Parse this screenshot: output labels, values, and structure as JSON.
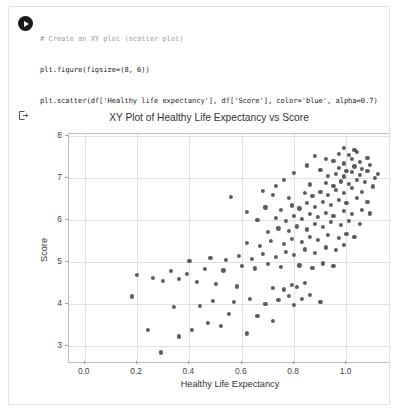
{
  "notebook": {
    "run_button": "run-cell",
    "output_marker": "output-arrow",
    "code_lines": [
      "# Create an XY plot (scatter plot)",
      "plt.figure(figsize=(8, 6))",
      "plt.scatter(df['Healthy life expectancy'], df['Score'], color='blue', alpha=0.7)",
      "plt.xlabel('Healthy Life Expectancy')",
      "plt.ylabel('Score')",
      "plt.title('XY Plot of Healthy Life Expectancy vs Score')",
      "plt.grid(True)",
      "plt.show()"
    ]
  },
  "chart_data": {
    "type": "scatter",
    "title": "XY Plot of Healthy Life Expectancy vs Score",
    "xlabel": "Healthy Life Expectancy",
    "ylabel": "Score",
    "grid": true,
    "legend": null,
    "marker_color": "#2f2f2f",
    "marker_alpha": 0.7,
    "xlim": [
      -0.06,
      1.17
    ],
    "ylim": [
      2.62,
      8.05
    ],
    "xticks": [
      0.0,
      0.2,
      0.4,
      0.6,
      0.8,
      1.0
    ],
    "xticklabels": [
      "0.0",
      "0.2",
      "0.4",
      "0.6",
      "0.8",
      "1.0"
    ],
    "yticks": [
      3,
      4,
      5,
      6,
      7,
      8
    ],
    "yticklabels": [
      "3",
      "4",
      "5",
      "6",
      "7",
      "8"
    ],
    "points": [
      [
        0.29,
        2.85
      ],
      [
        0.36,
        3.23
      ],
      [
        0.41,
        3.38
      ],
      [
        0.62,
        3.3
      ],
      [
        0.72,
        3.6
      ],
      [
        0.24,
        3.38
      ],
      [
        0.47,
        3.55
      ],
      [
        0.52,
        3.47
      ],
      [
        0.55,
        3.77
      ],
      [
        0.66,
        3.72
      ],
      [
        0.18,
        4.18
      ],
      [
        0.34,
        3.93
      ],
      [
        0.44,
        3.95
      ],
      [
        0.49,
        4.07
      ],
      [
        0.57,
        4.05
      ],
      [
        0.63,
        4.12
      ],
      [
        0.69,
        4.0
      ],
      [
        0.74,
        4.09
      ],
      [
        0.78,
        4.2
      ],
      [
        0.8,
        3.98
      ],
      [
        0.83,
        4.12
      ],
      [
        0.86,
        4.22
      ],
      [
        0.9,
        4.05
      ],
      [
        0.72,
        4.38
      ],
      [
        0.76,
        4.35
      ],
      [
        0.79,
        4.45
      ],
      [
        0.81,
        4.4
      ],
      [
        0.84,
        4.5
      ],
      [
        0.58,
        4.42
      ],
      [
        0.5,
        4.48
      ],
      [
        0.43,
        4.52
      ],
      [
        0.36,
        4.6
      ],
      [
        0.3,
        4.55
      ],
      [
        0.26,
        4.62
      ],
      [
        0.2,
        4.7
      ],
      [
        0.33,
        4.78
      ],
      [
        0.39,
        4.72
      ],
      [
        0.46,
        4.83
      ],
      [
        0.53,
        4.8
      ],
      [
        0.6,
        4.9
      ],
      [
        0.65,
        4.85
      ],
      [
        0.7,
        4.95
      ],
      [
        0.75,
        4.88
      ],
      [
        0.82,
        4.92
      ],
      [
        0.87,
        4.86
      ],
      [
        0.91,
        4.97
      ],
      [
        0.95,
        4.9
      ],
      [
        0.4,
        5.02
      ],
      [
        0.48,
        5.1
      ],
      [
        0.54,
        5.05
      ],
      [
        0.59,
        5.15
      ],
      [
        0.64,
        5.08
      ],
      [
        0.68,
        5.2
      ],
      [
        0.73,
        5.12
      ],
      [
        0.77,
        5.25
      ],
      [
        0.8,
        5.18
      ],
      [
        0.84,
        5.3
      ],
      [
        0.88,
        5.22
      ],
      [
        0.92,
        5.35
      ],
      [
        0.96,
        5.28
      ],
      [
        0.99,
        5.4
      ],
      [
        0.62,
        5.45
      ],
      [
        0.67,
        5.38
      ],
      [
        0.71,
        5.5
      ],
      [
        0.76,
        5.44
      ],
      [
        0.79,
        5.56
      ],
      [
        0.83,
        5.48
      ],
      [
        0.86,
        5.6
      ],
      [
        0.89,
        5.52
      ],
      [
        0.93,
        5.64
      ],
      [
        0.97,
        5.57
      ],
      [
        1.0,
        5.68
      ],
      [
        1.03,
        5.6
      ],
      [
        0.7,
        5.72
      ],
      [
        0.74,
        5.8
      ],
      [
        0.78,
        5.74
      ],
      [
        0.81,
        5.85
      ],
      [
        0.85,
        5.78
      ],
      [
        0.88,
        5.9
      ],
      [
        0.91,
        5.83
      ],
      [
        0.94,
        5.95
      ],
      [
        0.98,
        5.88
      ],
      [
        1.01,
        5.98
      ],
      [
        1.05,
        5.9
      ],
      [
        0.66,
        6.0
      ],
      [
        0.73,
        6.05
      ],
      [
        0.77,
        5.98
      ],
      [
        0.8,
        6.1
      ],
      [
        0.83,
        6.03
      ],
      [
        0.86,
        6.14
      ],
      [
        0.89,
        6.07
      ],
      [
        0.92,
        6.18
      ],
      [
        0.95,
        6.1
      ],
      [
        0.99,
        6.22
      ],
      [
        1.02,
        6.14
      ],
      [
        1.06,
        6.25
      ],
      [
        1.09,
        6.16
      ],
      [
        0.62,
        6.2
      ],
      [
        0.69,
        6.3
      ],
      [
        0.75,
        6.24
      ],
      [
        0.79,
        6.35
      ],
      [
        0.82,
        6.28
      ],
      [
        0.85,
        6.4
      ],
      [
        0.88,
        6.32
      ],
      [
        0.91,
        6.44
      ],
      [
        0.94,
        6.36
      ],
      [
        0.97,
        6.48
      ],
      [
        1.0,
        6.4
      ],
      [
        1.04,
        6.52
      ],
      [
        1.08,
        6.44
      ],
      [
        0.56,
        6.55
      ],
      [
        0.72,
        6.6
      ],
      [
        0.78,
        6.53
      ],
      [
        0.84,
        6.64
      ],
      [
        0.87,
        6.57
      ],
      [
        0.9,
        6.68
      ],
      [
        0.93,
        6.6
      ],
      [
        0.96,
        6.72
      ],
      [
        0.99,
        6.64
      ],
      [
        1.02,
        6.76
      ],
      [
        1.06,
        6.68
      ],
      [
        1.1,
        6.8
      ],
      [
        0.86,
        6.85
      ],
      [
        0.92,
        6.88
      ],
      [
        0.95,
        6.82
      ],
      [
        0.98,
        6.92
      ],
      [
        1.01,
        6.86
      ],
      [
        1.04,
        6.96
      ],
      [
        1.07,
        6.9
      ],
      [
        1.11,
        7.0
      ],
      [
        0.93,
        7.05
      ],
      [
        0.96,
        7.1
      ],
      [
        0.99,
        7.04
      ],
      [
        1.02,
        7.14
      ],
      [
        1.05,
        7.08
      ],
      [
        1.08,
        7.18
      ],
      [
        1.12,
        7.1
      ],
      [
        0.9,
        7.2
      ],
      [
        0.97,
        7.25
      ],
      [
        1.0,
        7.18
      ],
      [
        1.03,
        7.28
      ],
      [
        1.06,
        7.22
      ],
      [
        1.09,
        7.32
      ],
      [
        0.95,
        7.4
      ],
      [
        0.99,
        7.35
      ],
      [
        1.02,
        7.45
      ],
      [
        1.05,
        7.38
      ],
      [
        1.08,
        7.48
      ],
      [
        0.97,
        7.58
      ],
      [
        1.01,
        7.55
      ],
      [
        1.04,
        7.62
      ],
      [
        0.99,
        7.72
      ],
      [
        1.03,
        7.68
      ],
      [
        0.88,
        7.52
      ],
      [
        0.92,
        7.45
      ],
      [
        0.85,
        7.3
      ],
      [
        0.8,
        7.12
      ],
      [
        0.76,
        6.95
      ],
      [
        0.73,
        6.82
      ],
      [
        0.68,
        6.7
      ]
    ]
  }
}
